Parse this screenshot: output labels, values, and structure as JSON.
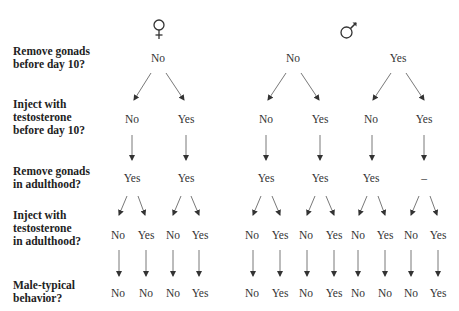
{
  "sexes": [
    {
      "name": "female",
      "symbol": "♀"
    },
    {
      "name": "male",
      "symbol": "♂"
    }
  ],
  "questions": [
    {
      "line1": "Remove gonads",
      "line2": "before day 10?",
      "line3": ""
    },
    {
      "line1": "Inject with",
      "line2": "testosterone",
      "line3": "before day 10?"
    },
    {
      "line1": "Remove gonads",
      "line2": "in adulthood?",
      "line3": ""
    },
    {
      "line1": "Inject with",
      "line2": "testosterone",
      "line3": "in adulthood?"
    },
    {
      "line1": "Male-typical",
      "line2": "behavior?",
      "line3": ""
    }
  ],
  "level1": [
    "No",
    "No",
    "Yes"
  ],
  "level2": [
    "No",
    "Yes",
    "No",
    "Yes",
    "No",
    "Yes"
  ],
  "level3": [
    "Yes",
    "Yes",
    "Yes",
    "Yes",
    "Yes",
    "–"
  ],
  "level4": [
    "No",
    "Yes",
    "No",
    "Yes",
    "No",
    "Yes",
    "No",
    "Yes",
    "No",
    "Yes",
    "No",
    "Yes"
  ],
  "level5": [
    "No",
    "No",
    "No",
    "Yes",
    "No",
    "Yes",
    "No",
    "Yes",
    "No",
    "No",
    "No",
    "Yes"
  ]
}
